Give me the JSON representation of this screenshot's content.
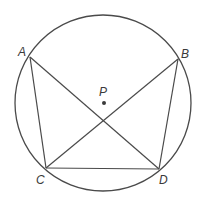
{
  "diagram": {
    "type": "inscribed-quadrilateral",
    "circle": {
      "cx": 103,
      "cy": 103,
      "r": 88
    },
    "center": {
      "label": "P",
      "x": 104,
      "y": 103
    },
    "points": [
      {
        "label": "A",
        "x": 30,
        "y": 57
      },
      {
        "label": "B",
        "x": 178,
        "y": 59
      },
      {
        "label": "C",
        "x": 46,
        "y": 168
      },
      {
        "label": "D",
        "x": 159,
        "y": 169
      }
    ],
    "segments": [
      [
        "A",
        "C"
      ],
      [
        "A",
        "D"
      ],
      [
        "B",
        "C"
      ],
      [
        "B",
        "D"
      ],
      [
        "C",
        "D"
      ]
    ],
    "labels": {
      "A": "A",
      "B": "B",
      "C": "C",
      "D": "D",
      "P": "P"
    },
    "colors": {
      "stroke": "#4a4a4a",
      "text": "#3a3a3a"
    }
  }
}
